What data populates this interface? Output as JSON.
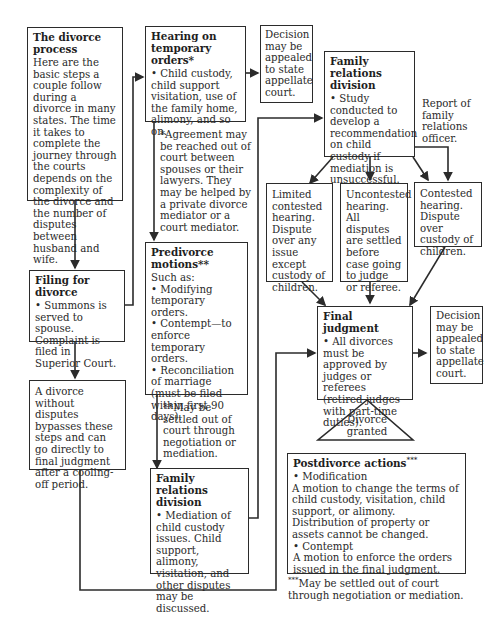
{
  "diagram": {
    "intro": {
      "title": "The divorce process",
      "body": "Here are the basic steps a couple follow during a divorce in many states. The time it takes to complete the journey through the courts depends on the complexity of the divorce and the number of disputes between husband and wife."
    },
    "filing": {
      "title": "Filing for divorce",
      "body": "• Summons is served to spouse. Complaint is filed in Superior Court."
    },
    "bypass": {
      "body": "A divorce without disputes bypasses these steps and can go directly to final judgment after a cooling-off period."
    },
    "hearing_temp": {
      "title": "Hearing on temporary orders*",
      "body": "• Child custody, child support visitation, use of the family home, alimony, and so on."
    },
    "hearing_note": "*Agreement may be reached out of court between spouses or their lawyers. They may be helped by a private divorce mediator or a court mediator.",
    "appeal_top": "Decision may be appealed to state appellate court.",
    "predivorce": {
      "title": "Predivorce motions**",
      "intro": "Such as:",
      "items": [
        "• Modifying temporary orders.",
        "• Contempt—to enforce temporary orders.",
        "• Reconciliation of marriage (must be filed within first 90 days)."
      ]
    },
    "predivorce_note": "**May be settled out of court through negotiation or mediation.",
    "frd_bottom": {
      "title": "Family relations division",
      "body": "• Mediation of child custody issues. Child support, alimony, visitation, and other disputes may be discussed."
    },
    "frd_top": {
      "title": "Family relations division",
      "body": "• Study conducted to develop a recommendation on child custody if mediation is unsuccessful."
    },
    "report_note": "Report of family relations officer.",
    "limited": "Limited contested hearing. Dispute over any issue except custody of children.",
    "uncontested": "Uncontested hearing. All disputes are settled before case going to judge or referee.",
    "contested": "Contested hearing. Dispute over custody of children.",
    "final": {
      "title": "Final judgment",
      "body": "• All divorces must be approved by judges or referees (retired judges with part-time duties)."
    },
    "appeal_final": "Decision may be appealed to state appellate court.",
    "granted": "Divorce granted",
    "postdivorce": {
      "title": "Postdivorce actions",
      "title_mark": "***",
      "mod_head": "• Modification",
      "mod_body": "A motion to change the terms of child custody, visitation, child support, or alimony. Distribution of property or assets cannot be changed.",
      "con_head": "• Contempt",
      "con_body": "A motion to enforce the orders issued in the final judgment."
    },
    "post_note_mark": "***",
    "post_note": "May be settled out of court through negotiation or mediation."
  },
  "colors": {
    "line": "#2b2b2b",
    "text": "#2a2a2a",
    "background": "#ffffff"
  }
}
